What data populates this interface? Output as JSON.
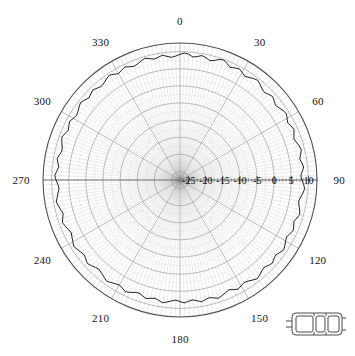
{
  "figure": {
    "type": "polar-plot",
    "background_color": "#ffffff",
    "grid_color": "#9a9a9a",
    "trace_color": "#222222",
    "axis_color": "#555555"
  },
  "angular_labels": [
    {
      "text": "0",
      "deg": 0
    },
    {
      "text": "30",
      "deg": 30
    },
    {
      "text": "60",
      "deg": 60
    },
    {
      "text": "90",
      "deg": 90
    },
    {
      "text": "120",
      "deg": 120
    },
    {
      "text": "150",
      "deg": 150
    },
    {
      "text": "180",
      "deg": 180
    },
    {
      "text": "210",
      "deg": 210
    },
    {
      "text": "240",
      "deg": 240
    },
    {
      "text": "270",
      "deg": 270
    },
    {
      "text": "300",
      "deg": 300
    },
    {
      "text": "330",
      "deg": 330
    }
  ],
  "radial_labels": [
    "-25",
    "-20",
    "-15",
    "-10",
    "-5",
    "0",
    "5",
    "10"
  ],
  "legend_icon": {
    "name": "car-top-view-icon",
    "label": ""
  },
  "chart_data": {
    "type": "line",
    "title": "",
    "subtitle": "",
    "xlabel": "",
    "ylabel": "",
    "polar": true,
    "angle_unit": "degrees",
    "angle_zero_location": "N",
    "angle_direction": "clockwise",
    "grid": true,
    "legend_position": "bottom-right",
    "legend": [],
    "rlim": [
      -27.5,
      12.5
    ],
    "rticks": [
      -25,
      -20,
      -15,
      -10,
      -5,
      0,
      5,
      10
    ],
    "rtick_labels": [
      "-25",
      "-20",
      "-15",
      "-10",
      "-5",
      "0",
      "5",
      "10"
    ],
    "rlabel_angle": 90,
    "theta_ticks": [
      0,
      30,
      60,
      90,
      120,
      150,
      180,
      210,
      240,
      270,
      300,
      330
    ],
    "theta_minor_step": 10,
    "annotations": [],
    "series": [
      {
        "name": "measured pattern",
        "color": "#222222",
        "theta": [
          0,
          2,
          4,
          6,
          8,
          10,
          12,
          14,
          16,
          18,
          20,
          22,
          24,
          26,
          28,
          30,
          32,
          34,
          36,
          38,
          40,
          42,
          44,
          46,
          48,
          50,
          52,
          54,
          56,
          58,
          60,
          62,
          64,
          66,
          68,
          70,
          72,
          74,
          76,
          78,
          80,
          82,
          84,
          86,
          88,
          90,
          92,
          94,
          96,
          98,
          100,
          102,
          104,
          106,
          108,
          110,
          112,
          114,
          116,
          118,
          120,
          122,
          124,
          126,
          128,
          130,
          132,
          134,
          136,
          138,
          140,
          142,
          144,
          146,
          148,
          150,
          152,
          154,
          156,
          158,
          160,
          162,
          164,
          166,
          168,
          170,
          172,
          174,
          176,
          178,
          180,
          182,
          184,
          186,
          188,
          190,
          192,
          194,
          196,
          198,
          200,
          202,
          204,
          206,
          208,
          210,
          212,
          214,
          216,
          218,
          220,
          222,
          224,
          226,
          228,
          230,
          232,
          234,
          236,
          238,
          240,
          242,
          244,
          246,
          248,
          250,
          252,
          254,
          256,
          258,
          260,
          262,
          264,
          266,
          268,
          270,
          272,
          274,
          276,
          278,
          280,
          282,
          284,
          286,
          288,
          290,
          292,
          294,
          296,
          298,
          300,
          302,
          304,
          306,
          308,
          310,
          312,
          314,
          316,
          318,
          320,
          322,
          324,
          326,
          328,
          330,
          332,
          334,
          336,
          338,
          340,
          342,
          344,
          346,
          348,
          350,
          352,
          354,
          356,
          358
        ],
        "r": [
          9.2,
          9.6,
          9.3,
          8.6,
          8.9,
          9.4,
          9.0,
          8.4,
          8.8,
          9.5,
          9.8,
          9.2,
          8.5,
          8.9,
          9.3,
          8.8,
          8.2,
          8.6,
          9.1,
          9.4,
          8.9,
          8.3,
          8.0,
          8.5,
          8.9,
          8.4,
          7.9,
          8.3,
          8.8,
          9.1,
          8.6,
          8.1,
          8.5,
          8.9,
          8.4,
          7.9,
          8.2,
          8.7,
          9.0,
          8.5,
          8.0,
          8.4,
          8.8,
          8.3,
          7.8,
          8.1,
          8.6,
          9.0,
          8.6,
          8.1,
          7.7,
          8.0,
          8.5,
          8.9,
          8.4,
          7.9,
          8.3,
          8.7,
          8.2,
          7.8,
          8.1,
          8.6,
          9.0,
          8.5,
          8.0,
          8.3,
          8.8,
          8.4,
          7.9,
          8.2,
          8.7,
          9.1,
          8.6,
          8.1,
          7.8,
          8.2,
          8.6,
          8.1,
          7.6,
          8.0,
          8.4,
          8.8,
          8.3,
          7.9,
          8.2,
          8.6,
          8.1,
          7.7,
          8.0,
          8.4,
          8.0,
          7.6,
          7.9,
          8.3,
          8.7,
          8.2,
          7.8,
          8.1,
          8.5,
          8.0,
          7.6,
          7.9,
          8.4,
          8.8,
          8.3,
          7.9,
          8.2,
          8.6,
          9.0,
          8.5,
          8.1,
          7.7,
          8.0,
          8.5,
          8.9,
          8.4,
          8.0,
          8.3,
          8.7,
          9.1,
          8.6,
          8.2,
          7.8,
          8.1,
          8.6,
          9.0,
          8.5,
          8.0,
          8.4,
          8.8,
          9.2,
          8.7,
          8.3,
          7.9,
          8.2,
          8.7,
          9.1,
          8.6,
          8.1,
          8.5,
          8.9,
          8.4,
          8.0,
          8.3,
          8.8,
          9.2,
          8.7,
          8.2,
          8.6,
          9.0,
          8.5,
          8.1,
          8.4,
          8.9,
          9.3,
          8.8,
          8.3,
          8.7,
          9.1,
          8.6,
          8.2,
          8.5,
          9.0,
          9.4,
          8.9,
          8.4,
          8.8,
          9.2,
          8.7,
          8.3,
          8.6,
          9.1,
          9.5,
          9.0,
          8.6,
          8.9,
          9.3,
          8.8,
          8.4,
          8.7,
          9.2,
          9.6,
          9.1
        ]
      }
    ]
  }
}
